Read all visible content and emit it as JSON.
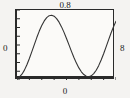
{
  "figure": {
    "labels": {
      "top": "0.8",
      "bottom": "0",
      "left": "0",
      "right": "8"
    }
  },
  "chart_data": {
    "type": "line",
    "title": "",
    "subtitle": "",
    "xlabel": "",
    "ylabel": "",
    "grid": false,
    "legend": null,
    "axis_labels": {
      "top": "0.8",
      "bottom": "0",
      "left": "0",
      "right": "8"
    },
    "xlim": [
      0,
      8
    ],
    "ylim": [
      0,
      0.8
    ],
    "x_ticks": [
      0,
      1,
      2,
      3,
      4,
      5,
      6,
      7,
      8
    ],
    "y_ticks": [
      0.0,
      0.1,
      0.2,
      0.3,
      0.4,
      0.5,
      0.6,
      0.7,
      0.8
    ],
    "series": [
      {
        "name": "curve",
        "color": "#333333",
        "x": [
          0.0,
          0.2,
          0.4,
          0.6,
          0.8,
          1.0,
          1.2,
          1.4,
          1.6,
          1.8,
          2.0,
          2.2,
          2.4,
          2.6,
          2.8,
          3.0,
          3.2,
          3.4,
          3.6,
          3.8,
          4.0,
          4.2,
          4.4,
          4.6,
          4.8,
          5.0,
          5.2,
          5.4,
          5.6,
          5.8,
          6.0,
          6.2,
          6.4,
          6.6,
          6.8,
          7.0,
          7.2,
          7.4,
          7.6,
          7.8,
          8.0
        ],
        "y": [
          0.02,
          0.035,
          0.066,
          0.113,
          0.174,
          0.245,
          0.324,
          0.405,
          0.485,
          0.559,
          0.623,
          0.675,
          0.713,
          0.735,
          0.74,
          0.729,
          0.702,
          0.661,
          0.607,
          0.544,
          0.474,
          0.401,
          0.327,
          0.257,
          0.193,
          0.138,
          0.094,
          0.062,
          0.043,
          0.038,
          0.048,
          0.073,
          0.112,
          0.164,
          0.228,
          0.3,
          0.378,
          0.458,
          0.537,
          0.609,
          0.672
        ]
      }
    ]
  }
}
